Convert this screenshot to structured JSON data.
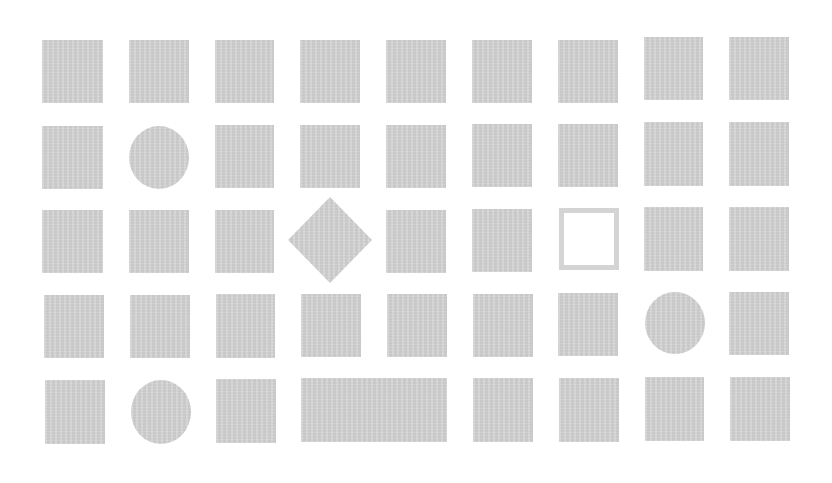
{
  "board": {
    "rows": 5,
    "columns": 9,
    "fill_color": "#d2d2d2",
    "background_color": "#ffffff",
    "shapes": [
      {
        "row": 1,
        "col": 1,
        "type": "square",
        "x": 42,
        "y": 40,
        "w": 61,
        "h": 63
      },
      {
        "row": 1,
        "col": 2,
        "type": "square",
        "x": 129,
        "y": 40,
        "w": 60,
        "h": 63
      },
      {
        "row": 1,
        "col": 3,
        "type": "square",
        "x": 215,
        "y": 40,
        "w": 59,
        "h": 63
      },
      {
        "row": 1,
        "col": 4,
        "type": "square",
        "x": 300,
        "y": 40,
        "w": 60,
        "h": 63
      },
      {
        "row": 1,
        "col": 5,
        "type": "square",
        "x": 386,
        "y": 40,
        "w": 60,
        "h": 63
      },
      {
        "row": 1,
        "col": 6,
        "type": "square",
        "x": 472,
        "y": 40,
        "w": 60,
        "h": 63
      },
      {
        "row": 1,
        "col": 7,
        "type": "square",
        "x": 558,
        "y": 40,
        "w": 60,
        "h": 63
      },
      {
        "row": 1,
        "col": 8,
        "type": "square",
        "x": 644,
        "y": 37,
        "w": 59,
        "h": 63
      },
      {
        "row": 1,
        "col": 9,
        "type": "square",
        "x": 729,
        "y": 37,
        "w": 60,
        "h": 63
      },
      {
        "row": 2,
        "col": 1,
        "type": "square",
        "x": 42,
        "y": 126,
        "w": 61,
        "h": 63
      },
      {
        "row": 2,
        "col": 2,
        "type": "circle",
        "x": 129,
        "y": 126,
        "w": 60,
        "h": 63
      },
      {
        "row": 2,
        "col": 3,
        "type": "square",
        "x": 215,
        "y": 125,
        "w": 59,
        "h": 63
      },
      {
        "row": 2,
        "col": 4,
        "type": "square",
        "x": 300,
        "y": 125,
        "w": 60,
        "h": 63
      },
      {
        "row": 2,
        "col": 5,
        "type": "square",
        "x": 386,
        "y": 125,
        "w": 60,
        "h": 63
      },
      {
        "row": 2,
        "col": 6,
        "type": "square",
        "x": 472,
        "y": 124,
        "w": 60,
        "h": 63
      },
      {
        "row": 2,
        "col": 7,
        "type": "square",
        "x": 558,
        "y": 124,
        "w": 60,
        "h": 63
      },
      {
        "row": 2,
        "col": 8,
        "type": "square",
        "x": 644,
        "y": 122,
        "w": 59,
        "h": 64
      },
      {
        "row": 2,
        "col": 9,
        "type": "square",
        "x": 729,
        "y": 122,
        "w": 60,
        "h": 64
      },
      {
        "row": 3,
        "col": 1,
        "type": "square",
        "x": 42,
        "y": 210,
        "w": 61,
        "h": 63
      },
      {
        "row": 3,
        "col": 2,
        "type": "square",
        "x": 129,
        "y": 210,
        "w": 60,
        "h": 63
      },
      {
        "row": 3,
        "col": 3,
        "type": "square",
        "x": 215,
        "y": 210,
        "w": 59,
        "h": 63
      },
      {
        "row": 3,
        "col": 4,
        "type": "diamond",
        "x": 288,
        "y": 197,
        "w": 84,
        "h": 86
      },
      {
        "row": 3,
        "col": 5,
        "type": "square",
        "x": 386,
        "y": 210,
        "w": 60,
        "h": 63
      },
      {
        "row": 3,
        "col": 6,
        "type": "square",
        "x": 472,
        "y": 209,
        "w": 60,
        "h": 63
      },
      {
        "row": 3,
        "col": 7,
        "type": "hollow-square",
        "x": 559,
        "y": 208,
        "w": 60,
        "h": 62
      },
      {
        "row": 3,
        "col": 8,
        "type": "square",
        "x": 644,
        "y": 207,
        "w": 59,
        "h": 64
      },
      {
        "row": 3,
        "col": 9,
        "type": "square",
        "x": 729,
        "y": 207,
        "w": 60,
        "h": 64
      },
      {
        "row": 4,
        "col": 1,
        "type": "square",
        "x": 44,
        "y": 295,
        "w": 60,
        "h": 63
      },
      {
        "row": 4,
        "col": 2,
        "type": "square",
        "x": 130,
        "y": 295,
        "w": 60,
        "h": 63
      },
      {
        "row": 4,
        "col": 3,
        "type": "square",
        "x": 216,
        "y": 294,
        "w": 59,
        "h": 64
      },
      {
        "row": 4,
        "col": 4,
        "type": "square",
        "x": 301,
        "y": 294,
        "w": 60,
        "h": 63
      },
      {
        "row": 4,
        "col": 5,
        "type": "square",
        "x": 387,
        "y": 294,
        "w": 60,
        "h": 63
      },
      {
        "row": 4,
        "col": 6,
        "type": "square",
        "x": 473,
        "y": 294,
        "w": 60,
        "h": 63
      },
      {
        "row": 4,
        "col": 7,
        "type": "square",
        "x": 558,
        "y": 293,
        "w": 60,
        "h": 63
      },
      {
        "row": 4,
        "col": 8,
        "type": "circle",
        "x": 645,
        "y": 292,
        "w": 60,
        "h": 62
      },
      {
        "row": 4,
        "col": 9,
        "type": "square",
        "x": 729,
        "y": 292,
        "w": 60,
        "h": 63
      },
      {
        "row": 5,
        "col": 1,
        "type": "square",
        "x": 45,
        "y": 380,
        "w": 60,
        "h": 64
      },
      {
        "row": 5,
        "col": 2,
        "type": "circle",
        "x": 131,
        "y": 380,
        "w": 60,
        "h": 64
      },
      {
        "row": 5,
        "col": 3,
        "type": "square",
        "x": 216,
        "y": 379,
        "w": 60,
        "h": 64
      },
      {
        "row": 5,
        "col": "4-5",
        "type": "wide-rectangle",
        "x": 301,
        "y": 378,
        "w": 146,
        "h": 64
      },
      {
        "row": 5,
        "col": 6,
        "type": "square",
        "x": 473,
        "y": 378,
        "w": 60,
        "h": 64
      },
      {
        "row": 5,
        "col": 7,
        "type": "square",
        "x": 559,
        "y": 378,
        "w": 60,
        "h": 64
      },
      {
        "row": 5,
        "col": 8,
        "type": "square",
        "x": 645,
        "y": 377,
        "w": 59,
        "h": 64
      },
      {
        "row": 5,
        "col": 9,
        "type": "square",
        "x": 730,
        "y": 377,
        "w": 60,
        "h": 64
      }
    ]
  }
}
